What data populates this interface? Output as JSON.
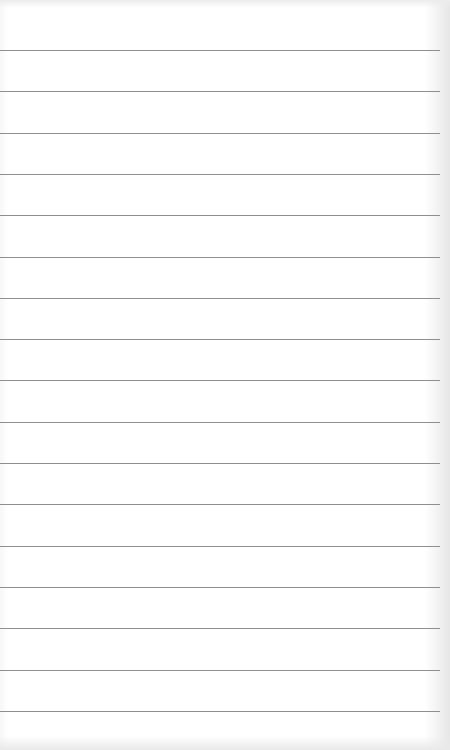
{
  "paper": {
    "type": "ruled-notebook-page",
    "line_color": "#8e8e8e",
    "background_color": "#ffffff",
    "rule_count": 17,
    "rules_y": [
      50,
      91,
      133,
      174,
      215,
      257,
      298,
      339,
      380,
      422,
      463,
      504,
      546,
      587,
      628,
      670,
      711
    ]
  }
}
